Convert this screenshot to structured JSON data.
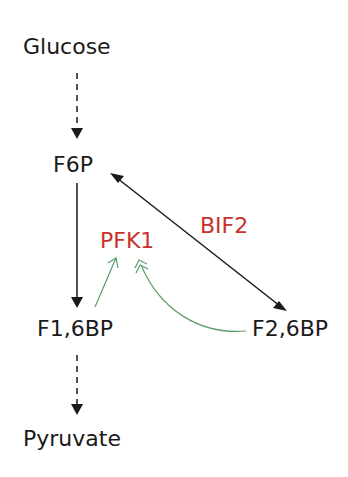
{
  "diagram": {
    "nodes": {
      "glucose": "Glucose",
      "f6p": "F6P",
      "f16bp": "F1,6BP",
      "f26bp": "F2,6BP",
      "pyruvate": "Pyruvate"
    },
    "enzymes": {
      "pfk1": "PFK1",
      "bif2": "BIF2"
    },
    "colors": {
      "text": "#1a1a1a",
      "enzyme": "#c8312c",
      "activation": "#5a9e6a"
    },
    "edges": [
      {
        "from": "Glucose",
        "to": "F6P",
        "style": "dashed"
      },
      {
        "from": "F6P",
        "to": "F1,6BP",
        "style": "solid"
      },
      {
        "from": "F1,6BP",
        "to": "Pyruvate",
        "style": "dashed"
      },
      {
        "from": "F6P",
        "to": "F2,6BP",
        "style": "bidirectional",
        "label": "BIF2"
      },
      {
        "from": "F1,6BP",
        "to": "PFK1",
        "style": "activation"
      },
      {
        "from": "F2,6BP",
        "to": "PFK1",
        "style": "strong-activation"
      }
    ]
  }
}
